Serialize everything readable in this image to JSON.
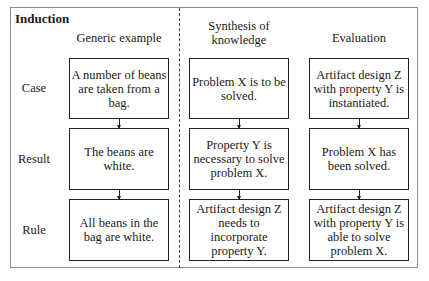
{
  "diagram": {
    "title": "Induction",
    "columns": [
      {
        "heading": "Generic example",
        "boxes": [
          "A number of beans are taken from a bag.",
          "The beans are white.",
          "All beans in the bag are white."
        ]
      },
      {
        "heading": "Synthesis of knowledge",
        "boxes": [
          "Problem X is to be solved.",
          "Property Y is necessary to solve problem X.",
          "Artifact design Z needs to incorporate property Y."
        ]
      },
      {
        "heading": "Evaluation",
        "boxes": [
          "Artifact design Z with property Y is instantiated.",
          "Problem X has been solved.",
          "Artifact design Z with property Y is able to solve problem X."
        ]
      }
    ],
    "rows": [
      "Case",
      "Result",
      "Rule"
    ]
  }
}
